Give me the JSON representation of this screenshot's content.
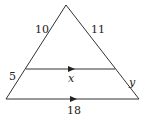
{
  "diagram": {
    "type": "triangle-proportionality",
    "labels": {
      "upper_left": "10",
      "upper_right": "11",
      "lower_left": "5",
      "lower_right": "y",
      "middle_segment": "x",
      "base": "18"
    },
    "colors": {
      "stroke": "#333333",
      "text": "#222222",
      "background": "#ffffff"
    }
  }
}
